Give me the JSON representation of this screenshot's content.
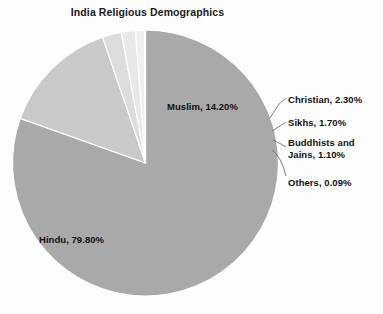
{
  "chart_data": {
    "type": "pie",
    "title": "India Religious Demographics",
    "xlabel": "",
    "ylabel": "",
    "legend_position": "none",
    "grid": false,
    "start_angle_deg": 0,
    "direction": "clockwise",
    "categories": [
      "Hindu",
      "Muslim",
      "Christian",
      "Sikhs",
      "Buddhists and Jains",
      "Others"
    ],
    "values": [
      79.8,
      14.2,
      2.3,
      1.7,
      1.1,
      0.09
    ],
    "unit": "%",
    "colors": [
      "#a9a9a9",
      "#c9c9c9",
      "#dcdcdc",
      "#e8e8e8",
      "#f0f0f0",
      "#f7f7f7"
    ],
    "slice_border_color": "#ffffff",
    "slices": [
      {
        "name": "Hindu",
        "value": 79.8,
        "label": "Hindu, 79.80%",
        "color": "#a9a9a9",
        "label_placement": "inside"
      },
      {
        "name": "Muslim",
        "value": 14.2,
        "label": "Muslim, 14.20%",
        "color": "#c9c9c9",
        "label_placement": "inside"
      },
      {
        "name": "Christian",
        "value": 2.3,
        "label": "Christian, 2.30%",
        "color": "#dcdcdc",
        "label_placement": "callout-right"
      },
      {
        "name": "Sikhs",
        "value": 1.7,
        "label": "Sikhs, 1.70%",
        "color": "#e8e8e8",
        "label_placement": "callout-right"
      },
      {
        "name": "Buddhists and Jains",
        "value": 1.1,
        "label_line1": "Buddhists and",
        "label_line2": "Jains, 1.10%",
        "color": "#f0f0f0",
        "label_placement": "callout-right"
      },
      {
        "name": "Others",
        "value": 0.09,
        "label": "Others, 0.09%",
        "color": "#f7f7f7",
        "label_placement": "callout-right"
      }
    ]
  },
  "chart": {
    "title": "India Religious Demographics",
    "labels": {
      "hindu": "Hindu, 79.80%",
      "muslim": "Muslim, 14.20%",
      "christian": "Christian, 2.30%",
      "sikhs": "Sikhs, 1.70%",
      "buddhists_line1": "Buddhists and",
      "buddhists_line2": "Jains, 1.10%",
      "others": "Others, 0.09%"
    }
  }
}
